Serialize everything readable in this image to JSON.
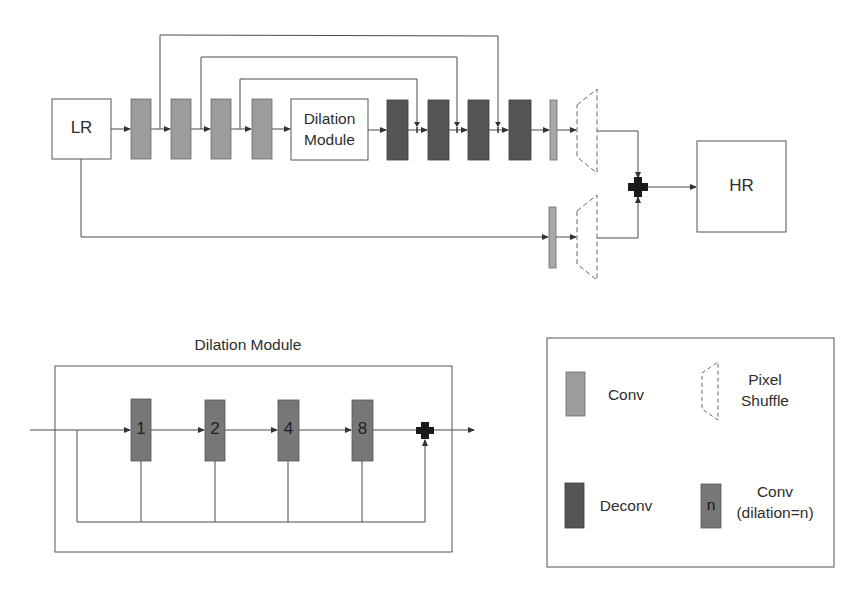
{
  "main_network": {
    "input_label": "LR",
    "output_label": "HR",
    "dilation_module_label_line1": "Dilation",
    "dilation_module_label_line2": "Module",
    "conv_blocks": 4,
    "deconv_blocks": 4,
    "skip_connections": 3
  },
  "dilation_module": {
    "title": "Dilation Module",
    "dilation_rates": [
      "1",
      "2",
      "4",
      "8"
    ]
  },
  "legend": {
    "conv_label": "Conv",
    "pixel_shuffle_line1": "Pixel",
    "pixel_shuffle_line2": "Shuffle",
    "deconv_label": "Deconv",
    "dilated_conv_symbol": "n",
    "dilated_conv_line1": "Conv",
    "dilated_conv_line2": "(dilation=n)"
  },
  "colors": {
    "conv": "#9c9c9c",
    "deconv": "#555555",
    "dilated_conv": "#777777",
    "line": "#4a4a4a",
    "plus": "#1a1a1a"
  }
}
